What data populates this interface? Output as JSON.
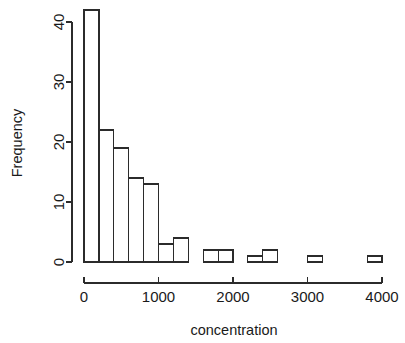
{
  "chart_data": {
    "type": "bar",
    "subtype": "histogram",
    "title": "",
    "xlabel": "concentration",
    "ylabel": "Frequency",
    "xlim": [
      0,
      4000
    ],
    "ylim": [
      0,
      42
    ],
    "grid": false,
    "legend": null,
    "bin_width": 200,
    "bin_edges": [
      0,
      200,
      400,
      600,
      800,
      1000,
      1200,
      1400,
      1600,
      1800,
      2000,
      2200,
      2400,
      2600,
      2800,
      3000,
      3200,
      3400,
      3600,
      3800,
      4000
    ],
    "categories": [
      "0-200",
      "200-400",
      "400-600",
      "600-800",
      "800-1000",
      "1000-1200",
      "1200-1400",
      "1400-1600",
      "1600-1800",
      "1800-2000",
      "2000-2200",
      "2200-2400",
      "2400-2600",
      "2600-2800",
      "2800-3000",
      "3000-3200",
      "3200-3400",
      "3400-3600",
      "3600-3800",
      "3800-4000"
    ],
    "values": [
      42,
      22,
      19,
      14,
      13,
      3,
      4,
      0,
      2,
      2,
      0,
      1,
      2,
      0,
      0,
      1,
      0,
      0,
      0,
      1
    ],
    "xticks": [
      0,
      1000,
      2000,
      3000,
      4000
    ],
    "xtick_labels": [
      "0",
      "1000",
      "2000",
      "3000",
      "4000"
    ],
    "yticks": [
      0,
      10,
      20,
      30,
      40
    ],
    "ytick_labels": [
      "0",
      "10",
      "20",
      "30",
      "40"
    ],
    "total_count": 126,
    "bar_fill_color": "#ffffff",
    "bar_stroke_color": "#2b2b2b",
    "background_color": "#ffffff"
  }
}
